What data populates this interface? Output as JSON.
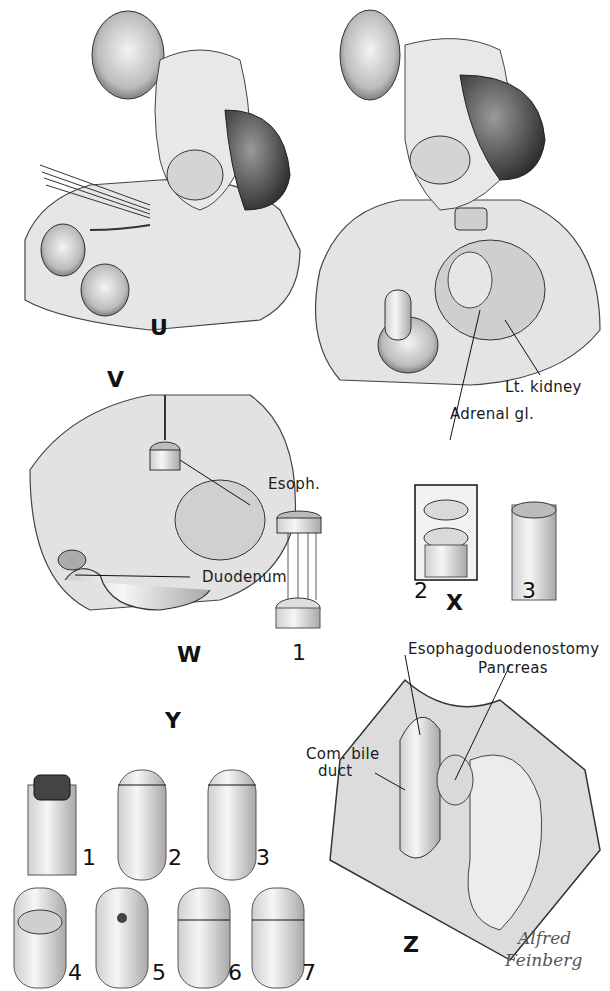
{
  "figure": {
    "type": "surgical illustration plate (pencil drawing)",
    "panels": {
      "U": {
        "letter": "U"
      },
      "V": {
        "letter": "V",
        "labels": {
          "kidney": "Lt. kidney",
          "adrenal": "Adrenal gl."
        }
      },
      "W": {
        "letter": "W",
        "labels": {
          "esoph": "Esoph.",
          "duodenum": "Duodenum"
        }
      },
      "X": {
        "letter": "X",
        "steps": [
          "1",
          "2",
          "3"
        ]
      },
      "Y": {
        "letter": "Y",
        "steps": [
          "1",
          "2",
          "3",
          "4",
          "5",
          "6",
          "7"
        ]
      },
      "Z": {
        "letter": "Z",
        "labels": {
          "anastomosis": "Esophagoduodenostomy",
          "pancreas": "Pancreas",
          "bile_duct_1": "Com. bile",
          "bile_duct_2": "duct"
        }
      }
    },
    "signature": {
      "line1": "Alfred",
      "line2": "Feinberg"
    }
  },
  "colors": {
    "ink": "#1a1a1a",
    "shade_dark": "#3a3a3a",
    "shade_mid": "#9a9a9a",
    "shade_light": "#d8d8d8",
    "paper": "#ffffff"
  }
}
